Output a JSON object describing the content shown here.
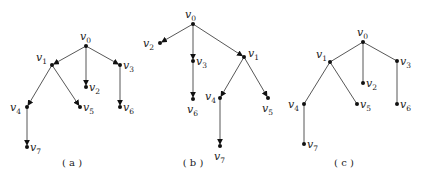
{
  "figure": {
    "panels": [
      {
        "id": "a",
        "caption": "(a)",
        "caption_pos": [
          72,
          166
        ],
        "directed": true,
        "nodes": [
          {
            "id": "v0",
            "x": 86,
            "y": 46,
            "lx": 80,
            "ly": 40
          },
          {
            "id": "v1",
            "x": 52,
            "y": 65,
            "lx": 36,
            "ly": 61
          },
          {
            "id": "v2",
            "x": 86,
            "y": 87,
            "lx": 89,
            "ly": 91
          },
          {
            "id": "v3",
            "x": 120,
            "y": 65,
            "lx": 123,
            "ly": 69
          },
          {
            "id": "v4",
            "x": 27,
            "y": 107,
            "lx": 10,
            "ly": 111
          },
          {
            "id": "v5",
            "x": 80,
            "y": 107,
            "lx": 83,
            "ly": 111
          },
          {
            "id": "v6",
            "x": 120,
            "y": 107,
            "lx": 123,
            "ly": 111
          },
          {
            "id": "v7",
            "x": 27,
            "y": 147,
            "lx": 30,
            "ly": 151
          }
        ],
        "edges": [
          [
            "v0",
            "v1"
          ],
          [
            "v0",
            "v2"
          ],
          [
            "v0",
            "v3"
          ],
          [
            "v1",
            "v4"
          ],
          [
            "v1",
            "v5"
          ],
          [
            "v3",
            "v6"
          ],
          [
            "v4",
            "v7"
          ]
        ]
      },
      {
        "id": "b",
        "caption": "(b)",
        "caption_pos": [
          193,
          166
        ],
        "directed": true,
        "nodes": [
          {
            "id": "v0",
            "x": 193,
            "y": 24,
            "lx": 185,
            "ly": 18
          },
          {
            "id": "v2",
            "x": 160,
            "y": 43,
            "lx": 143,
            "ly": 47
          },
          {
            "id": "v3",
            "x": 193,
            "y": 61,
            "lx": 196,
            "ly": 65
          },
          {
            "id": "v1",
            "x": 244,
            "y": 57,
            "lx": 248,
            "ly": 57
          },
          {
            "id": "v6",
            "x": 193,
            "y": 99,
            "lx": 187,
            "ly": 113
          },
          {
            "id": "v4",
            "x": 220,
            "y": 98,
            "lx": 205,
            "ly": 100
          },
          {
            "id": "v5",
            "x": 268,
            "y": 98,
            "lx": 262,
            "ly": 112
          },
          {
            "id": "v7",
            "x": 220,
            "y": 146,
            "lx": 214,
            "ly": 160
          }
        ],
        "edges": [
          [
            "v0",
            "v2"
          ],
          [
            "v0",
            "v3"
          ],
          [
            "v0",
            "v1"
          ],
          [
            "v3",
            "v6"
          ],
          [
            "v1",
            "v4"
          ],
          [
            "v1",
            "v5"
          ],
          [
            "v4",
            "v7"
          ]
        ]
      },
      {
        "id": "c",
        "caption": "(c)",
        "caption_pos": [
          344,
          166
        ],
        "directed": false,
        "nodes": [
          {
            "id": "v0",
            "x": 363,
            "y": 42,
            "lx": 357,
            "ly": 36
          },
          {
            "id": "v1",
            "x": 330,
            "y": 62,
            "lx": 316,
            "ly": 58
          },
          {
            "id": "v2",
            "x": 363,
            "y": 83,
            "lx": 366,
            "ly": 87
          },
          {
            "id": "v3",
            "x": 397,
            "y": 61,
            "lx": 400,
            "ly": 65
          },
          {
            "id": "v4",
            "x": 304,
            "y": 104,
            "lx": 288,
            "ly": 108
          },
          {
            "id": "v5",
            "x": 357,
            "y": 104,
            "lx": 360,
            "ly": 108
          },
          {
            "id": "v6",
            "x": 397,
            "y": 104,
            "lx": 400,
            "ly": 108
          },
          {
            "id": "v7",
            "x": 304,
            "y": 144,
            "lx": 307,
            "ly": 148
          }
        ],
        "edges": [
          [
            "v0",
            "v1"
          ],
          [
            "v0",
            "v2"
          ],
          [
            "v0",
            "v3"
          ],
          [
            "v1",
            "v4"
          ],
          [
            "v1",
            "v5"
          ],
          [
            "v3",
            "v6"
          ],
          [
            "v4",
            "v7"
          ]
        ]
      }
    ]
  }
}
